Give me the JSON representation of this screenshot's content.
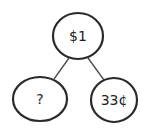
{
  "diagram": {
    "type": "number-bond",
    "colors": {
      "stroke": "#2a2a2a",
      "text": "#222222",
      "background": "#ffffff"
    },
    "nodes": [
      {
        "id": "whole",
        "label": "$1",
        "cx": 78,
        "cy": 36,
        "rx": 25,
        "ry": 23
      },
      {
        "id": "part-left",
        "label": "?",
        "cx": 40,
        "cy": 99,
        "rx": 27,
        "ry": 22
      },
      {
        "id": "part-right",
        "label": "33¢",
        "cx": 114,
        "cy": 100,
        "rx": 23,
        "ry": 22
      }
    ],
    "edges": [
      {
        "from": "whole",
        "to": "part-left"
      },
      {
        "from": "whole",
        "to": "part-right"
      }
    ]
  }
}
